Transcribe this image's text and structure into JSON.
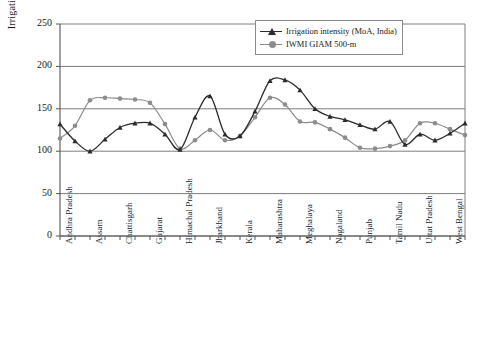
{
  "chart_data": {
    "type": "line",
    "title": "",
    "xlabel": "",
    "ylabel": "Irrigation intensity",
    "ylim": [
      0,
      250
    ],
    "yticks": [
      0,
      50,
      100,
      150,
      200,
      250
    ],
    "grid": "horizontal",
    "legend_position": "top-right",
    "categories": [
      "Andhra Pradesh",
      "",
      "Assam",
      "",
      "Chattisgarh",
      "",
      "Gujarat",
      "",
      "Himachal Pradesh",
      "",
      "Jharkhand",
      "",
      "Kerala",
      "",
      "Maharashtra",
      "",
      "Meghalaya",
      "",
      "Nagaland",
      "",
      "Punjab",
      "",
      "Tamil Nadu",
      "",
      "Uttat Pradesh",
      "",
      "West Bengal",
      ""
    ],
    "tick_labels": [
      "Andhra Pradesh",
      "Assam",
      "Chattisgarh",
      "Gujarat",
      "Himachal Pradesh",
      "Jharkhand",
      "Kerala",
      "Maharashtra",
      "Meghalaya",
      "Nagaland",
      "Punjab",
      "Tamil Nadu",
      "Uttat Pradesh",
      "West Bengal"
    ],
    "series": [
      {
        "name": "Irrigation intensity (MoA, India)",
        "color": "#2b2b2b",
        "marker": "triangle",
        "values": [
          132,
          112,
          100,
          114,
          128,
          133,
          133,
          120,
          102,
          140,
          165,
          120,
          118,
          147,
          183,
          184,
          172,
          150,
          141,
          137,
          131,
          126,
          135,
          108,
          120,
          113,
          121,
          133
        ]
      },
      {
        "name": "IWMI GIAM 500-m",
        "color": "#8c8c8c",
        "marker": "circle",
        "values": [
          115,
          130,
          160,
          163,
          162,
          161,
          157,
          132,
          103,
          113,
          125,
          113,
          118,
          140,
          163,
          155,
          135,
          134,
          126,
          116,
          104,
          103,
          106,
          113,
          133,
          133,
          126,
          119
        ]
      }
    ],
    "series2_tail": {
      "note": ""
    }
  },
  "legend": {
    "items": [
      {
        "label": "Irrigation intensity (MoA, India)",
        "color": "#2b2b2b",
        "marker": "triangle"
      },
      {
        "label": "IWMI GIAM 500-m",
        "color": "#8c8c8c",
        "marker": "circle"
      }
    ]
  },
  "axis": {
    "y_title": "Irrigation intensity",
    "y_labels": [
      "250",
      "200",
      "150",
      "100",
      "50",
      "0"
    ]
  }
}
